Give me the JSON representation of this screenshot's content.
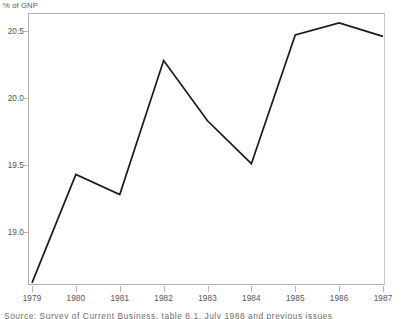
{
  "chart_data": {
    "type": "line",
    "title": "",
    "subtitle": "",
    "xlabel": "",
    "ylabel": "% of GNP",
    "x": [
      1979,
      1980,
      1981,
      1982,
      1983,
      1984,
      1985,
      1986,
      1987
    ],
    "categories": [
      "1979",
      "1980",
      "1981",
      "1982",
      "1983",
      "1984",
      "1985",
      "1986",
      "1987"
    ],
    "values": [
      18.62,
      19.43,
      19.28,
      20.28,
      19.83,
      19.51,
      20.47,
      20.56,
      20.46
    ],
    "series": [
      {
        "name": "% of GNP",
        "values": [
          18.62,
          19.43,
          19.28,
          20.28,
          19.83,
          19.51,
          20.47,
          20.56,
          20.46
        ],
        "color": "#1a1a1a"
      }
    ],
    "ylim": [
      18.55,
      20.6
    ],
    "xlim": [
      1979,
      1987
    ],
    "yticks": [
      19.0,
      19.5,
      20.0,
      20.5
    ],
    "ytick_labels": [
      "19.0",
      "19.5",
      "20.0",
      "20.5"
    ],
    "xticks": [
      1979,
      1980,
      1981,
      1982,
      1983,
      1984,
      1985,
      1986,
      1987
    ],
    "xtick_labels": [
      "1979",
      "1980",
      "1981",
      "1982",
      "1983",
      "1984",
      "1985",
      "1986",
      "1987"
    ],
    "grid": false,
    "legend": false,
    "legend_position": "none",
    "annotations": []
  },
  "axis": {
    "y_title": "% of GNP",
    "y_tick_labels": [
      "20.5",
      "20.0",
      "19.5",
      "19.0"
    ],
    "x_tick_labels": [
      "1979",
      "1980",
      "1981",
      "1982",
      "1983",
      "1984",
      "1985",
      "1986",
      "1987"
    ]
  },
  "caption": {
    "source_text": "Source: Survey of Current Business, table 8.1, July 1988 and previous issues"
  },
  "colors": {
    "line": "#1a1a1a",
    "frame": "#b0b0b0",
    "tick": "#b6b6b6",
    "text": "#555555",
    "title_text": "#5a5a5a",
    "background": "#ffffff"
  }
}
